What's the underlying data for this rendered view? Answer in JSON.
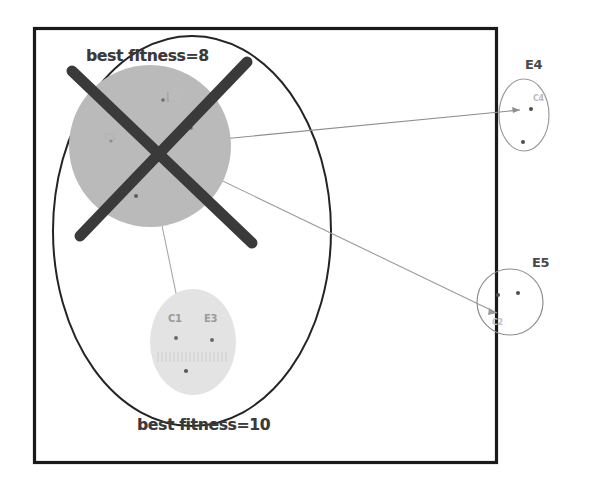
{
  "figure": {
    "type": "scanned-diagram",
    "caption_top": "best fitness=8",
    "caption_bottom": "best fitness=10",
    "background_color": "#ffffff",
    "frame": {
      "name": "figure-border",
      "x": 33,
      "y": 27,
      "width": 464,
      "height": 436,
      "stroke": "#1a1a1a",
      "stroke_width": 3.5
    },
    "outer_ellipse": {
      "name": "population-boundary",
      "cx": 192,
      "cy": 231,
      "rx": 139,
      "ry": 195,
      "stroke": "#222222",
      "stroke_width": 2
    },
    "crossed_out_marker": {
      "name": "cross-out-x",
      "color": "#3b3b3b",
      "stroke_width": 11,
      "stroke1": {
        "x1": 72,
        "y1": 71,
        "x2": 252,
        "y2": 243
      },
      "stroke2": {
        "x1": 247,
        "y1": 62,
        "x2": 80,
        "y2": 235
      }
    },
    "clusters": [
      {
        "id": "cluster-main",
        "shape": "circle",
        "cx": 150,
        "cy": 146,
        "r": 81,
        "fill": "#b9b9b9",
        "label": "",
        "inner_labels": [
          "C3",
          "E2"
        ],
        "points": [
          {
            "x": 163,
            "y": 100
          },
          {
            "x": 191,
            "y": 128
          },
          {
            "x": 136,
            "y": 196
          },
          {
            "x": 110,
            "y": 140
          }
        ]
      },
      {
        "id": "cluster-bottom",
        "shape": "ellipse",
        "cx": 193,
        "cy": 342,
        "rx": 43,
        "ry": 53,
        "fill": "#e2e2e2",
        "label": "",
        "inner_labels": [
          "C1",
          "E3"
        ],
        "points": [
          {
            "x": 176,
            "y": 338
          },
          {
            "x": 212,
            "y": 340
          },
          {
            "x": 186,
            "y": 370
          }
        ]
      },
      {
        "id": "cluster-e4",
        "shape": "ellipse",
        "cx": 524,
        "cy": 115,
        "rx": 25,
        "ry": 36,
        "fill": "none",
        "label": "E4",
        "inner_labels": [
          "C4"
        ],
        "points": [
          {
            "x": 530,
            "y": 110
          },
          {
            "x": 523,
            "y": 142
          }
        ]
      },
      {
        "id": "cluster-e5",
        "shape": "circle",
        "cx": 510,
        "cy": 302,
        "r": 33,
        "fill": "none",
        "label": "E5",
        "inner_labels": [
          "C2"
        ],
        "points": [
          {
            "x": 498,
            "y": 295
          },
          {
            "x": 518,
            "y": 293
          }
        ]
      }
    ],
    "connectors": [
      {
        "name": "connector-main-to-e4",
        "x1": 150,
        "y1": 146,
        "x2": 520,
        "y2": 110,
        "stroke": "#8e8e8e",
        "stroke_width": 1
      },
      {
        "name": "connector-main-to-e5",
        "x1": 150,
        "y1": 146,
        "x2": 500,
        "y2": 312,
        "stroke": "#9a9a9a",
        "stroke_width": 1
      },
      {
        "name": "connector-main-to-bottom",
        "x1": 150,
        "y1": 160,
        "x2": 182,
        "y2": 320,
        "stroke": "#a8a8a8",
        "stroke_width": 1
      }
    ]
  }
}
